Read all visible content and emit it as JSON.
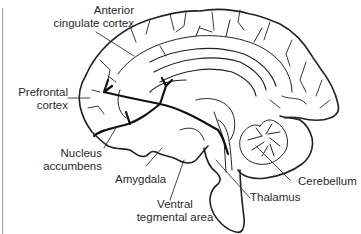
{
  "figure": {
    "type": "brain-sagittal-diagram",
    "line_color": "#222222",
    "pathway_color": "#111111",
    "labels": {
      "anterior_cingulate": [
        "Anterior",
        "cingulate cortex"
      ],
      "prefrontal": [
        "Prefrontal",
        "cortex"
      ],
      "nucleus_accumbens": [
        "Nucleus",
        "accumbens"
      ],
      "amygdala": [
        "Amygdala"
      ],
      "ventral_tegmental": [
        "Ventral",
        "tegmental area"
      ],
      "thalamus": [
        "Thalamus"
      ],
      "cerebellum": [
        "Cerebellum"
      ]
    }
  }
}
